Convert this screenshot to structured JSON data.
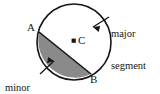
{
  "figure": {
    "name": "circle-segments-diagram",
    "background_color": "#ffffff",
    "stroke_color": "#151515",
    "shade_color": "#8a8a8a",
    "labels": {
      "point_a": "A",
      "point_b": "B",
      "centre": "C",
      "major_line1": "major",
      "major_line2": "segment",
      "minor_line1": "minor",
      "minor_line2": "segment"
    },
    "geometry": {
      "circle_center_x": 74,
      "circle_center_y": 42,
      "circle_radius_x": 37,
      "circle_radius_y": 38,
      "chord_start_x": 39,
      "chord_start_y": 32,
      "chord_end_x": 91,
      "chord_end_y": 74,
      "centre_marker_x": 74,
      "centre_marker_y": 41
    }
  }
}
